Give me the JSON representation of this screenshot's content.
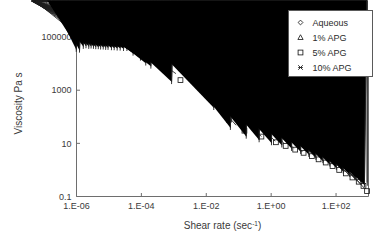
{
  "chart_data": {
    "type": "scatter",
    "title": "",
    "xlabel": "Shear rate (sec-1)",
    "xlabel_base": "Shear rate (sec",
    "xlabel_sup": "-1",
    "xlabel_tail": ")",
    "ylabel": "Viscosity Pa s",
    "xscale": "log",
    "yscale": "log",
    "xlim": [
      1e-06,
      1000
    ],
    "ylim": [
      0.1,
      1000000
    ],
    "grid": false,
    "legend_position": "top-right",
    "xticks": [
      "1.E-06",
      "1.E-04",
      "1.E-02",
      "1.E+00",
      "1.E+02"
    ],
    "xtick_values": [
      1e-06,
      0.0001,
      0.01,
      1,
      100
    ],
    "yticks": [
      "0.1",
      "10",
      "1000",
      "100000"
    ],
    "ytick_values": [
      0.1,
      10,
      1000,
      100000
    ],
    "series": [
      {
        "name": "Aqueous",
        "marker": "diamond",
        "points": [
          [
            1.5e-06,
            160000
          ],
          [
            1.8e-06,
            200000
          ],
          [
            2.1e-06,
            260000
          ],
          [
            2.5e-06,
            330000
          ],
          [
            2.9e-06,
            400000
          ],
          [
            3.4e-06,
            430000
          ],
          [
            4e-06,
            450000
          ],
          [
            4.7e-06,
            430000
          ],
          [
            5.5e-06,
            440000
          ],
          [
            6.5e-06,
            420000
          ],
          [
            7.6e-06,
            400000
          ],
          [
            9e-06,
            380000
          ],
          [
            1.1e-05,
            360000
          ],
          [
            1.3e-05,
            340000
          ],
          [
            1.6e-05,
            300000
          ],
          [
            2.2e-05,
            290000
          ],
          [
            2.8e-05,
            280000
          ],
          [
            4e-05,
            230000
          ],
          [
            5.5e-05,
            220000
          ],
          [
            0.00013,
            150000
          ],
          [
            0.00018,
            140000
          ],
          [
            0.0006,
            62000
          ],
          [
            0.04,
            700
          ],
          [
            0.11,
            95
          ],
          [
            0.3,
            72
          ],
          [
            1.0,
            42
          ],
          [
            2.0,
            22
          ],
          [
            4.0,
            10.5
          ],
          [
            7.0,
            9.0
          ],
          [
            12.0,
            6.0
          ],
          [
            20.0,
            4.6
          ],
          [
            32.0,
            3.4
          ],
          [
            50.0,
            2.6
          ],
          [
            80.0,
            2.0
          ],
          [
            130.0,
            1.4
          ],
          [
            200.0,
            1.05
          ],
          [
            320.0,
            0.72
          ],
          [
            500.0,
            0.48
          ],
          [
            700.0,
            0.34
          ],
          [
            900.0,
            0.27
          ]
        ]
      },
      {
        "name": "1% APG",
        "marker": "triangle",
        "points": [
          [
            1.3e-06,
            120000
          ],
          [
            1.6e-06,
            135000
          ],
          [
            1.9e-06,
            150000
          ],
          [
            2.3e-06,
            160000
          ],
          [
            2.7e-06,
            165000
          ],
          [
            3.2e-06,
            160000
          ],
          [
            3.8e-06,
            158000
          ],
          [
            4.5e-06,
            150000
          ],
          [
            5.3e-06,
            150000
          ],
          [
            6.3e-06,
            145000
          ],
          [
            7.5e-06,
            140000
          ],
          [
            9e-06,
            140000
          ],
          [
            1.1e-05,
            135000
          ],
          [
            1.3e-05,
            130000
          ],
          [
            1.6e-05,
            125000
          ],
          [
            2e-05,
            120000
          ],
          [
            2.6e-05,
            115000
          ],
          [
            3.4e-05,
            110000
          ],
          [
            4.5e-05,
            105000
          ],
          [
            6e-05,
            100000
          ],
          [
            9e-05,
            95000
          ],
          [
            0.00014,
            78000
          ],
          [
            0.0003,
            62000
          ],
          [
            0.0014,
            4200
          ],
          [
            0.1,
            48
          ],
          [
            0.6,
            18
          ],
          [
            1.6,
            12
          ],
          [
            3.0,
            10
          ],
          [
            6.0,
            6.5
          ],
          [
            11.0,
            4.8
          ],
          [
            19.0,
            3.6
          ],
          [
            30.0,
            2.8
          ],
          [
            50.0,
            2.1
          ],
          [
            80.0,
            1.6
          ],
          [
            130.0,
            1.15
          ],
          [
            210.0,
            0.85
          ],
          [
            330.0,
            0.58
          ],
          [
            520.0,
            0.4
          ],
          [
            720.0,
            0.28
          ],
          [
            920.0,
            0.2
          ]
        ]
      },
      {
        "name": "5% APG",
        "marker": "square",
        "points": [
          [
            1.2e-06,
            95000
          ],
          [
            1.5e-06,
            100000
          ],
          [
            1.8e-06,
            105000
          ],
          [
            2.2e-06,
            110000
          ],
          [
            2.6e-06,
            112000
          ],
          [
            3.1e-06,
            110000
          ],
          [
            3.7e-06,
            108000
          ],
          [
            4.4e-06,
            105000
          ],
          [
            5.2e-06,
            105000
          ],
          [
            6.2e-06,
            100000
          ],
          [
            7.4e-06,
            100000
          ],
          [
            8.8e-06,
            98000
          ],
          [
            1.1e-05,
            95000
          ],
          [
            1.3e-05,
            92000
          ],
          [
            1.6e-05,
            90000
          ],
          [
            2e-05,
            88000
          ],
          [
            2.5e-05,
            85000
          ],
          [
            3.2e-05,
            82000
          ],
          [
            4.2e-05,
            80000
          ],
          [
            5.5e-05,
            78000
          ],
          [
            8e-05,
            72000
          ],
          [
            0.00011,
            66000
          ],
          [
            0.00017,
            60000
          ],
          [
            0.00026,
            40000
          ],
          [
            0.0007,
            22000
          ],
          [
            0.0016,
            2400
          ],
          [
            0.05,
            78
          ],
          [
            0.15,
            30
          ],
          [
            0.5,
            18
          ],
          [
            1.4,
            11
          ],
          [
            2.8,
            8.0
          ],
          [
            5.5,
            5.8
          ],
          [
            10.0,
            4.4
          ],
          [
            18.0,
            3.3
          ],
          [
            29.0,
            2.5
          ],
          [
            48.0,
            1.9
          ],
          [
            78.0,
            1.4
          ],
          [
            125.0,
            1.0
          ],
          [
            200.0,
            0.74
          ],
          [
            320.0,
            0.52
          ],
          [
            500.0,
            0.36
          ],
          [
            700.0,
            0.25
          ],
          [
            900.0,
            0.16
          ]
        ]
      },
      {
        "name": "10% APG",
        "marker": "x",
        "points": [
          [
            1.1e-06,
            42000
          ],
          [
            1.15e-06,
            28000
          ],
          [
            1.4e-06,
            40000
          ],
          [
            1.45e-06,
            26000
          ],
          [
            1.9e-06,
            36000
          ],
          [
            2.3e-06,
            38000
          ],
          [
            2.8e-06,
            36000
          ],
          [
            3.3e-06,
            37000
          ],
          [
            3.9e-06,
            36000
          ],
          [
            4.6e-06,
            35000
          ],
          [
            5.5e-06,
            35000
          ],
          [
            6.5e-06,
            34000
          ],
          [
            7.8e-06,
            34000
          ],
          [
            9.3e-06,
            33000
          ],
          [
            1.1e-05,
            33000
          ],
          [
            1.4e-05,
            32000
          ],
          [
            1.7e-05,
            32000
          ],
          [
            2.1e-05,
            31000
          ],
          [
            2.6e-05,
            31000
          ],
          [
            3.3e-05,
            30000
          ],
          [
            4.2e-05,
            30000
          ],
          [
            6.5e-05,
            20000
          ],
          [
            0.00011,
            13000
          ],
          [
            0.00016,
            8500
          ],
          [
            0.00023,
            6500
          ],
          [
            0.001,
            1700
          ],
          [
            0.02,
            180
          ],
          [
            0.065,
            32
          ],
          [
            0.2,
            15
          ],
          [
            0.5,
            11
          ],
          [
            1.2,
            8.5
          ],
          [
            2.5,
            7.0
          ],
          [
            5.0,
            5.2
          ],
          [
            9.5,
            4.0
          ],
          [
            17.0,
            3.1
          ],
          [
            28.0,
            2.4
          ],
          [
            46.0,
            1.8
          ],
          [
            75.0,
            1.35
          ],
          [
            120.0,
            1.0
          ],
          [
            195.0,
            0.74
          ],
          [
            310.0,
            0.54
          ],
          [
            490.0,
            0.39
          ],
          [
            690.0,
            0.29
          ],
          [
            880.0,
            0.22
          ]
        ]
      }
    ]
  }
}
